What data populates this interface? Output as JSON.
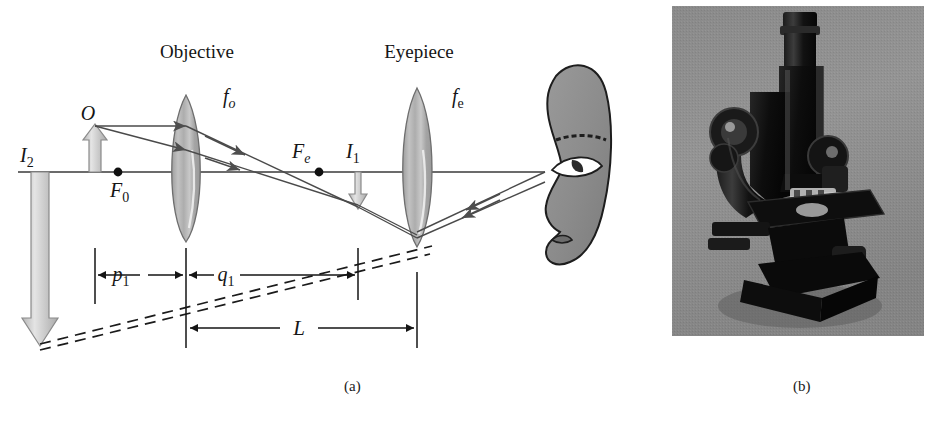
{
  "figure": {
    "panel_a": {
      "caption": "(a)",
      "title_objective": "Objective",
      "title_eyepiece": "Eyepiece",
      "labels": {
        "object": "O",
        "focal_objective": "f",
        "focal_objective_sub": "o",
        "focal_eyepiece": "f",
        "focal_eyepiece_sub": "e",
        "front_focus_objective": "F",
        "front_focus_objective_sub": "0",
        "focus_eyepiece": "F",
        "focus_eyepiece_sub": "e",
        "image_one": "I",
        "image_one_sub": "1",
        "image_two": "I",
        "image_two_sub": "2",
        "object_distance": "p",
        "object_distance_sub": "1",
        "image_distance": "q",
        "image_distance_sub": "1",
        "tube_length": "L"
      },
      "colors": {
        "ink": "#151515",
        "axis": "#3a3a3a",
        "lens_fill": "#b9b9b9",
        "lens_edge": "#6e6e6e",
        "arrow_gray": "#c9c9c9",
        "arrow_gray_edge": "#8a8a8a",
        "ray": "#4a4a4a",
        "dashed": "#1b1b1b",
        "head_fill": "#8e8e8e",
        "head_edge": "#1d1d1d"
      },
      "elements": {
        "optical_axis_y": 172,
        "objective_lens_x": 186,
        "eyepiece_lens_x": 417,
        "object_x": 95,
        "image1_x": 358,
        "focus_objective_x": 118,
        "focus_eyepiece_x": 319
      }
    },
    "panel_b": {
      "caption": "(b)",
      "photo_alt": "compound-microscope-photograph",
      "colors": {
        "backdrop": "#8d8d8d",
        "body": "#0d0d0d",
        "highlight": "#d8d8d8"
      }
    }
  }
}
